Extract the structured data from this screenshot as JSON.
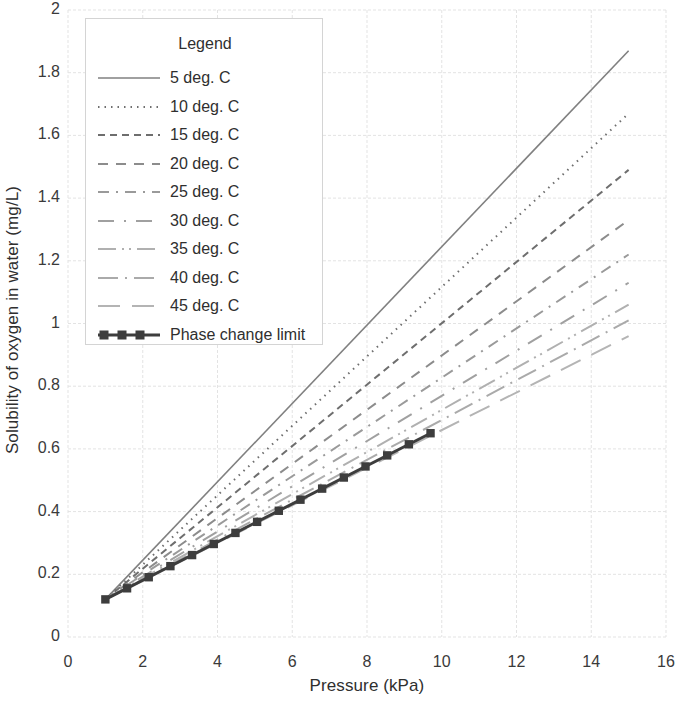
{
  "chart_data": {
    "type": "line",
    "title": "",
    "xlabel": "Pressure (kPa)",
    "ylabel": "Solubility of oxygen in water (mg/L)",
    "xlim": [
      0,
      16
    ],
    "ylim": [
      0,
      2
    ],
    "xticks": [
      "0",
      "2",
      "4",
      "6",
      "8",
      "10",
      "12",
      "14",
      "16"
    ],
    "yticks": [
      "0",
      "0.2",
      "0.4",
      "0.6",
      "0.8",
      "1",
      "1.2",
      "1.4",
      "1.6",
      "1.8",
      "2"
    ],
    "xtick_values": [
      0,
      2,
      4,
      6,
      8,
      10,
      12,
      14,
      16
    ],
    "ytick_values": [
      0,
      0.2,
      0.4,
      0.6,
      0.8,
      1,
      1.2,
      1.4,
      1.6,
      1.8,
      2
    ],
    "grid": true,
    "legend_position": "upper-left-inside",
    "legend_title": "Legend",
    "x": [
      1,
      15
    ],
    "series": [
      {
        "name": "5 deg. C",
        "values": [
          0.12,
          1.87
        ],
        "style": "solid",
        "color": "#808080",
        "width": 1.6
      },
      {
        "name": "10 deg. C",
        "values": [
          0.12,
          1.67
        ],
        "style": "dotted",
        "color": "#6e6e6e",
        "width": 2.0
      },
      {
        "name": "15 deg. C",
        "values": [
          0.12,
          1.49
        ],
        "style": "dashed-short",
        "color": "#6e6e6e",
        "width": 2.0
      },
      {
        "name": "20 deg. C",
        "values": [
          0.12,
          1.33
        ],
        "style": "dashed-medium",
        "color": "#8c8c8c",
        "width": 2.0
      },
      {
        "name": "25 deg. C",
        "values": [
          0.12,
          1.22
        ],
        "style": "dash-dot",
        "color": "#9a9a9a",
        "width": 2.0
      },
      {
        "name": "30 deg. C",
        "values": [
          0.12,
          1.13
        ],
        "style": "long-dash-dot",
        "color": "#a0a0a0",
        "width": 2.0
      },
      {
        "name": "35 deg. C",
        "values": [
          0.12,
          1.06
        ],
        "style": "dash-dot-dot",
        "color": "#b0b0b0",
        "width": 2.0
      },
      {
        "name": "40 deg. C",
        "values": [
          0.12,
          1.01
        ],
        "style": "long-dash-dot-2",
        "color": "#aaaaaa",
        "width": 2.0
      },
      {
        "name": "45 deg. C",
        "values": [
          0.12,
          0.96
        ],
        "style": "long-dash",
        "color": "#b4b4b4",
        "width": 2.0
      }
    ],
    "reference_series": {
      "name": "Phase change limit",
      "x": [
        1,
        9.7
      ],
      "values": [
        0.12,
        0.65
      ],
      "style": "solid-with-square-markers",
      "color": "#3d3d3d",
      "width": 3.0,
      "marker": "square"
    }
  },
  "legend": {
    "title": "Legend",
    "entries": [
      {
        "label": "5 deg. C"
      },
      {
        "label": "10 deg. C"
      },
      {
        "label": "15 deg. C"
      },
      {
        "label": "20 deg. C"
      },
      {
        "label": "25 deg. C"
      },
      {
        "label": "30 deg. C"
      },
      {
        "label": "35 deg. C"
      },
      {
        "label": "40 deg. C"
      },
      {
        "label": "45 deg. C"
      },
      {
        "label": "Phase change limit"
      }
    ]
  },
  "colors": {
    "grid": "#e3e3e3",
    "text": "#2f2f2f",
    "background": "#ffffff"
  }
}
